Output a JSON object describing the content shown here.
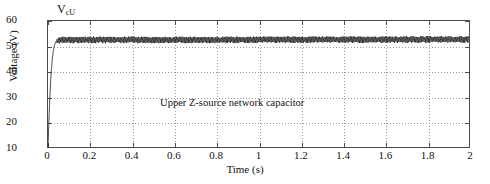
{
  "chart_data": {
    "type": "line",
    "title": "",
    "xlabel": "Time (s)",
    "ylabel": "Voltage (V)",
    "xlim": [
      0,
      2
    ],
    "ylim": [
      10,
      60
    ],
    "xticks": [
      "0",
      "0.2",
      "0.4",
      "0.6",
      "0.8",
      "1",
      "1.2",
      "1.4",
      "1.6",
      "1.8",
      "2"
    ],
    "xtick_values": [
      0,
      0.2,
      0.4,
      0.6,
      0.8,
      1.0,
      1.2,
      1.4,
      1.6,
      1.8,
      2.0
    ],
    "yticks": [
      "60",
      "50",
      "40",
      "30",
      "20",
      "10"
    ],
    "ytick_values": [
      60,
      50,
      40,
      30,
      20,
      10
    ],
    "grid": true,
    "grid_style": "dotted",
    "legend": "none",
    "series": [
      {
        "name": "V_cU",
        "label_text": "V",
        "label_sub": "cU",
        "color": "#1a1a1a",
        "description": "Upper Z-source network capacitor voltage: rapid exponential rise from about 10 V at t=0 to a steady state near 52.5 V reached by t~0.06 s, then a high-frequency switching ripple of roughly +/-1.2 V peak-to-peak about the 52.5 V mean for the remainder of the record.",
        "steady_state_value": 52.5,
        "ripple_peak_to_peak": 2.4,
        "rise_time_s": 0.06,
        "x": [
          0,
          0.005,
          0.01,
          0.015,
          0.02,
          0.025,
          0.03,
          0.035,
          0.04,
          0.05,
          0.06,
          0.08,
          0.1,
          0.2,
          0.4,
          0.6,
          0.8,
          1.0,
          1.2,
          1.4,
          1.6,
          1.8,
          2.0
        ],
        "y": [
          10.0,
          22.0,
          32.0,
          39.5,
          44.5,
          48.0,
          50.2,
          51.4,
          52.0,
          52.4,
          52.6,
          52.6,
          52.6,
          52.6,
          52.6,
          52.6,
          52.6,
          52.7,
          52.7,
          52.7,
          52.7,
          52.8,
          52.8
        ]
      }
    ],
    "annotations": [
      {
        "text": "Upper Z-source network capacitor",
        "x": 1.05,
        "y": 27.5
      }
    ]
  },
  "axes": {
    "x_title": "Time (s)",
    "y_title": "Voltage (V)"
  },
  "series_label": {
    "base": "V",
    "subscript": "cU"
  },
  "annotation": {
    "text": "Upper Z-source network capacitor"
  },
  "colors": {
    "trace": "#1a1a1a",
    "frame": "#4d4d4d",
    "grid": "#9a9a9a",
    "background": "#ffffff"
  }
}
